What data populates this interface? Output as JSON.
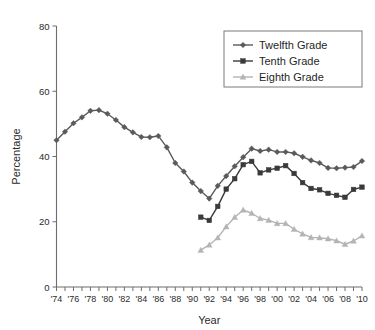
{
  "chart_data": {
    "type": "line",
    "title": "",
    "xlabel": "Year",
    "ylabel": "Percentage",
    "xlim": [
      1974,
      2010
    ],
    "ylim": [
      0,
      80
    ],
    "yticks": [
      0,
      20,
      40,
      60,
      80
    ],
    "ytick_labels": [
      "0",
      "20",
      "40",
      "60",
      "80"
    ],
    "xticks": [
      1974,
      1976,
      1978,
      1980,
      1982,
      1984,
      1986,
      1988,
      1990,
      1992,
      1994,
      1996,
      1998,
      2000,
      2002,
      2004,
      2006,
      2008,
      2010
    ],
    "xtick_labels": [
      "'74",
      "'76",
      "'78",
      "'80",
      "'82",
      "'84",
      "'86",
      "'88",
      "'90",
      "'92",
      "'94",
      "'96",
      "'98",
      "'00",
      "'02",
      "'04",
      "'06",
      "'08",
      "'10"
    ],
    "minor_xticks_every": 1,
    "grid": false,
    "legend_position": "top-right",
    "series": [
      {
        "name": "Twelfth Grade",
        "color": "#5a5a5a",
        "marker": "diamond",
        "x": [
          1974,
          1975,
          1976,
          1977,
          1978,
          1979,
          1980,
          1981,
          1982,
          1983,
          1984,
          1985,
          1986,
          1987,
          1988,
          1989,
          1990,
          1991,
          1992,
          1993,
          1994,
          1995,
          1996,
          1997,
          1998,
          1999,
          2000,
          2001,
          2002,
          2003,
          2004,
          2005,
          2006,
          2007,
          2008,
          2009,
          2010
        ],
        "values": [
          45.0,
          47.6,
          50.2,
          52.0,
          54.0,
          54.2,
          53.1,
          51.2,
          49.0,
          47.4,
          46.0,
          45.9,
          46.3,
          42.8,
          38.0,
          35.4,
          32.0,
          29.4,
          27.1,
          31.0,
          34.0,
          37.0,
          39.8,
          42.4,
          41.7,
          42.1,
          41.4,
          41.4,
          41.0,
          39.9,
          38.8,
          38.0,
          36.5,
          36.4,
          36.6,
          36.8,
          38.6
        ]
      },
      {
        "name": "Tenth Grade",
        "color": "#3a3a3a",
        "marker": "square",
        "x": [
          1991,
          1992,
          1993,
          1994,
          1995,
          1996,
          1997,
          1998,
          1999,
          2000,
          2001,
          2002,
          2003,
          2004,
          2005,
          2006,
          2007,
          2008,
          2009,
          2010
        ],
        "values": [
          21.4,
          20.4,
          24.7,
          30.0,
          33.2,
          37.5,
          38.5,
          35.0,
          35.9,
          36.4,
          37.2,
          34.8,
          32.0,
          30.2,
          29.8,
          28.7,
          28.1,
          27.5,
          29.9,
          30.6
        ]
      },
      {
        "name": "Eighth Grade",
        "color": "#b4b4b4",
        "marker": "triangle",
        "x": [
          1991,
          1992,
          1993,
          1994,
          1995,
          1996,
          1997,
          1998,
          1999,
          2000,
          2001,
          2002,
          2003,
          2004,
          2005,
          2006,
          2007,
          2008,
          2009,
          2010
        ],
        "values": [
          11.3,
          12.9,
          15.1,
          18.5,
          21.4,
          23.6,
          22.6,
          21.0,
          20.5,
          19.5,
          19.5,
          17.7,
          16.3,
          15.2,
          15.1,
          14.8,
          14.2,
          13.1,
          14.1,
          15.7
        ]
      }
    ]
  },
  "legend": {
    "items": [
      {
        "label": "Twelfth Grade"
      },
      {
        "label": "Tenth Grade"
      },
      {
        "label": "Eighth Grade"
      }
    ]
  },
  "axes": {
    "y_title": "Percentage",
    "x_title": "Year"
  }
}
